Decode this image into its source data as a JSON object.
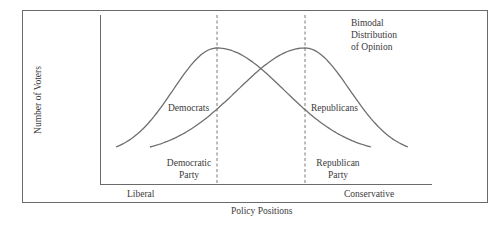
{
  "figure": {
    "title_lines": [
      "Bimodal",
      "Distribution",
      "of Opinion"
    ],
    "y_axis_label": "Number of Voters",
    "x_axis_label": "Policy Positions",
    "x_left_label": "Liberal",
    "x_right_label": "Conservative",
    "curves": [
      {
        "name": "Democrats",
        "label": "Democrats",
        "peak_position": 0.35
      },
      {
        "name": "Republicans",
        "label": "Republicans",
        "peak_position": 0.62
      }
    ],
    "party_markers": [
      {
        "name": "democratic-party",
        "label_lines": [
          "Democratic",
          "Party"
        ],
        "position": 0.35
      },
      {
        "name": "republican-party",
        "label_lines": [
          "Republican",
          "Party"
        ],
        "position": 0.62
      }
    ],
    "colors": {
      "line": "#6e6e6e",
      "frame": "#6a6a6a",
      "text": "#3a3a3a"
    }
  }
}
